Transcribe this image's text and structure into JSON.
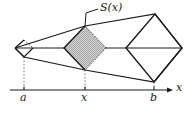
{
  "figure": {
    "background_color": "#ffffff",
    "stroke_color": "#1a1a1a",
    "fill_color": "#c8c8c8",
    "labels": {
      "cross_section": "S(x)",
      "left_bound": "a",
      "sample_point": "x",
      "right_bound": "b",
      "axis": "x"
    },
    "axis": {
      "y": 90,
      "x_start": 10,
      "x_end": 172,
      "arrow": "right",
      "ticks": [
        {
          "label": "a",
          "x": 24
        },
        {
          "label": "x",
          "x": 85
        },
        {
          "label": "b",
          "x": 154
        }
      ]
    },
    "cross_sections": [
      {
        "name": "a-section",
        "center_x": 24,
        "center_y": 48,
        "half_width": 9,
        "half_height": 9,
        "shaded": false
      },
      {
        "name": "s-of-x-section",
        "center_x": 85,
        "center_y": 48,
        "half_width": 21,
        "half_height": 22,
        "shaded": true
      },
      {
        "name": "b-section",
        "center_x": 154,
        "center_y": 48,
        "half_width": 28,
        "half_height": 34,
        "shaded": false
      }
    ],
    "leader_line": {
      "from_x": 98,
      "from_y": 9,
      "elbow_x": 85,
      "elbow_y": 13,
      "to_x": 85,
      "to_y": 27
    },
    "drop_lines": [
      {
        "from_x": 24,
        "from_y": 57,
        "to_y": 90
      },
      {
        "from_x": 85,
        "from_y": 70,
        "to_y": 90
      },
      {
        "from_x": 154,
        "from_y": 82,
        "to_y": 90
      }
    ]
  }
}
